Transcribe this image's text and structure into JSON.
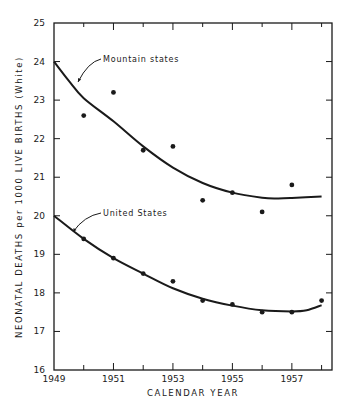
{
  "chart_data": {
    "type": "scatter",
    "title": "",
    "xlabel": "CALENDAR YEAR",
    "ylabel": "NEONATAL DEATHS per 1000 LIVE BIRTHS (White)",
    "xlim": [
      1949,
      1958.35
    ],
    "ylim": [
      16,
      25
    ],
    "x_tick_labels": [
      "1949",
      "1951",
      "1953",
      "1955",
      "1957"
    ],
    "x_ticks_major": [
      1949,
      1951,
      1953,
      1955,
      1957
    ],
    "x_ticks_minor": [
      1950,
      1952,
      1954,
      1956,
      1958
    ],
    "y_ticks": [
      16,
      17,
      18,
      19,
      20,
      21,
      22,
      23,
      24,
      25
    ],
    "y_tick_labels": [
      "16",
      "17",
      "18",
      "19",
      "20",
      "21",
      "22",
      "23",
      "24",
      "25"
    ],
    "grid": false,
    "legend": "inline labels with pointer arrows",
    "series": [
      {
        "name": "Mountain states",
        "x": [
          1950,
          1951,
          1952,
          1953,
          1954,
          1955,
          1956,
          1957
        ],
        "values": [
          22.6,
          23.2,
          21.7,
          21.8,
          20.4,
          20.6,
          20.1,
          20.8
        ],
        "fitted_curve": {
          "x": [
            1949,
            1949.5,
            1950,
            1951,
            1952,
            1953,
            1954,
            1955,
            1956,
            1956.5,
            1957,
            1958
          ],
          "y": [
            24.0,
            23.5,
            23.05,
            22.45,
            21.8,
            21.25,
            20.85,
            20.6,
            20.47,
            20.45,
            20.46,
            20.5
          ]
        },
        "label_position": {
          "x": 103,
          "y": 62
        },
        "pointer": {
          "from": [
            101,
            59
          ],
          "ctrl": [
            88,
            62
          ],
          "to": [
            78,
            82
          ]
        }
      },
      {
        "name": "United States",
        "x": [
          1950,
          1951,
          1952,
          1953,
          1954,
          1955,
          1956,
          1957,
          1958
        ],
        "values": [
          19.4,
          18.9,
          18.5,
          18.3,
          17.8,
          17.7,
          17.5,
          17.5,
          17.8
        ],
        "fitted_curve": {
          "x": [
            1949,
            1950,
            1951,
            1952,
            1953,
            1954,
            1955,
            1956,
            1957,
            1957.5,
            1958
          ],
          "y": [
            20.0,
            19.4,
            18.9,
            18.5,
            18.12,
            17.85,
            17.67,
            17.55,
            17.52,
            17.55,
            17.68
          ]
        },
        "label_position": {
          "x": 103,
          "y": 216
        },
        "pointer": {
          "from": [
            101,
            213
          ],
          "ctrl": [
            84,
            216
          ],
          "to": [
            73,
            232
          ]
        }
      }
    ]
  },
  "plot_box": {
    "left": 54,
    "top": 23,
    "right": 332,
    "bottom": 370
  }
}
